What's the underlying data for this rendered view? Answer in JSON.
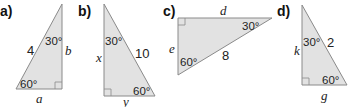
{
  "figures": [
    {
      "label": "a)",
      "angles": [
        "30°",
        "60°"
      ],
      "sides": {
        "hypotenuse": "4",
        "vertical": "b",
        "base": "a"
      }
    },
    {
      "label": "b)",
      "angles": [
        "30°",
        "60°"
      ],
      "sides": {
        "hypotenuse": "10",
        "vertical": "x",
        "base": "y"
      }
    },
    {
      "label": "c)",
      "angles": [
        "30°",
        "60°"
      ],
      "sides": {
        "hypotenuse": "8",
        "vertical": "e",
        "top": "d"
      }
    },
    {
      "label": "d)",
      "angles": [
        "30°",
        "60°"
      ],
      "sides": {
        "hypotenuse": "2",
        "vertical": "k",
        "base": "g"
      }
    }
  ],
  "colors": {
    "fill": "#e2e2e2",
    "stroke": "#8a8a8a",
    "text": "#222222"
  }
}
